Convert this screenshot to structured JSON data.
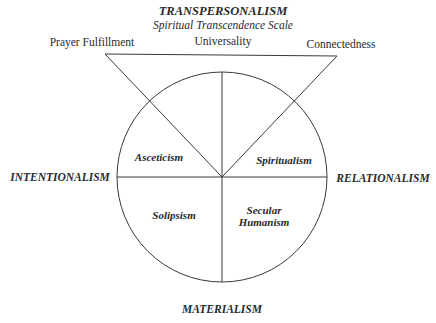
{
  "diagram": {
    "title": "TRANSPERSONALISM",
    "subtitle": "Spiritual Transcendence Scale",
    "triangle_vertices": {
      "left": "Prayer Fulfillment",
      "top": "Universality",
      "right": "Connectedness"
    },
    "axes": {
      "top": "TRANSPERSONALISM",
      "left": "INTENTIONALISM",
      "right": "RELATIONALISM",
      "bottom": "MATERIALISM"
    },
    "sectors": {
      "upper_left": "Asceticism",
      "upper_right": "Spiritualism",
      "lower_left": "Solipsism",
      "lower_right_line1": "Secular",
      "lower_right_line2": "Humanism"
    },
    "colors": {
      "line": "#3a3a3a",
      "text": "#2a2a2a",
      "background": "#ffffff"
    }
  }
}
